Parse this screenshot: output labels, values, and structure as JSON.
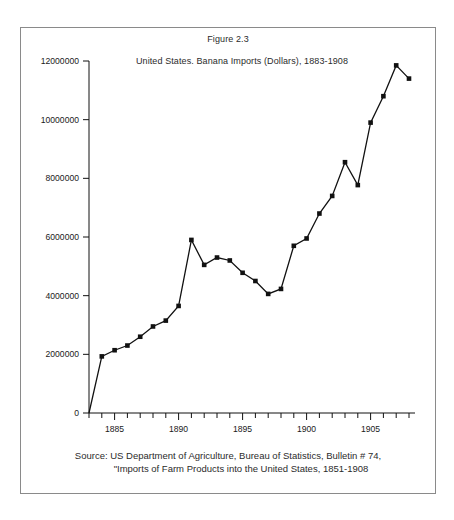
{
  "figure": {
    "caption": "Figure 2.3",
    "source_line_1": "Source: US Department of Agriculture, Bureau of Statistics, Bulletin # 74,",
    "source_line_2": "\"Imports of Farm Products into the United States, 1851-1908"
  },
  "chart_data": {
    "type": "line",
    "title": "United States. Banana Imports (Dollars), 1883-1908",
    "xlabel": "",
    "ylabel": "",
    "xlim": [
      1883,
      1908
    ],
    "ylim": [
      0,
      12000000
    ],
    "grid": false,
    "legend": null,
    "marker": "square",
    "line_color": "#111111",
    "marker_color": "#111111",
    "x_tick_labels": [
      "1885",
      "1890",
      "1895",
      "1900",
      "1905"
    ],
    "x_tick_values": [
      1885,
      1890,
      1895,
      1900,
      1905
    ],
    "x_minor_ticks_every": 1,
    "y_tick_labels": [
      "0",
      "2000000",
      "4000000",
      "6000000",
      "8000000",
      "10000000",
      "12000000"
    ],
    "y_tick_values": [
      0,
      2000000,
      4000000,
      6000000,
      8000000,
      10000000,
      12000000
    ],
    "x": [
      1883,
      1884,
      1885,
      1886,
      1887,
      1888,
      1889,
      1890,
      1891,
      1892,
      1893,
      1894,
      1895,
      1896,
      1897,
      1898,
      1899,
      1900,
      1901,
      1902,
      1903,
      1904,
      1905,
      1906,
      1907,
      1908
    ],
    "values": [
      0,
      1930000,
      2140000,
      2300000,
      2600000,
      2950000,
      3150000,
      3650000,
      5900000,
      5050000,
      5300000,
      5200000,
      4780000,
      4500000,
      4060000,
      4230000,
      5700000,
      5950000,
      6800000,
      7400000,
      8550000,
      7770000,
      9900000,
      10800000,
      11850000,
      11400000
    ]
  }
}
